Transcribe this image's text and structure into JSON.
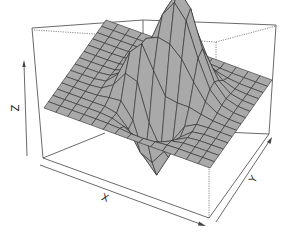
{
  "chart_data": {
    "type": "surface3d",
    "title": "",
    "xlabel": "X",
    "ylabel": "Y",
    "zlabel": "Z",
    "ticks": "none (arrow axes only)",
    "box": true,
    "surface_color": "#a9a9a9",
    "mesh_color": "#2a2a2a",
    "grid": {
      "nx": 14,
      "ny": 14,
      "xrange": [
        0,
        1
      ],
      "yrange": [
        0,
        1
      ]
    },
    "features": [
      {
        "kind": "peak",
        "x": 0.58,
        "y": 0.62,
        "height": 1.0,
        "width": 0.11
      },
      {
        "kind": "peak",
        "x": 0.42,
        "y": 0.42,
        "height": 0.55,
        "width": 0.08
      },
      {
        "kind": "dip",
        "x": 0.55,
        "y": 0.3,
        "height": -0.65,
        "width": 0.09
      }
    ]
  },
  "projection": {
    "origin": [
      44,
      160
    ],
    "x_vec": [
      166,
      60
    ],
    "y_vec": [
      62,
      -88
    ],
    "z_base": 0,
    "z_scale": 98,
    "plane_offset": -52
  },
  "labels": {
    "x": "X",
    "y": "Y",
    "z": "Z"
  }
}
